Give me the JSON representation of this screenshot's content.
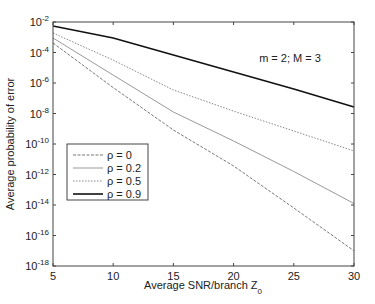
{
  "chart_data": {
    "type": "line",
    "title": "",
    "annotation": "m = 2; M = 3",
    "xlabel": "Average SNR/branch Z",
    "xlabel_subscript": "0",
    "ylabel": "Average probability of error",
    "xlim": [
      5,
      30
    ],
    "ylim_log10": [
      -18,
      -2
    ],
    "yscale": "log",
    "grid": false,
    "legend_position": "lower-left",
    "x_ticks": [
      5,
      10,
      15,
      20,
      25,
      30
    ],
    "y_ticks": [
      {
        "base": "10",
        "exp": "-2",
        "log": -2
      },
      {
        "base": "10",
        "exp": "-4",
        "log": -4
      },
      {
        "base": "10",
        "exp": "-6",
        "log": -6
      },
      {
        "base": "10",
        "exp": "-8",
        "log": -8
      },
      {
        "base": "10",
        "exp": "-10",
        "log": -10
      },
      {
        "base": "10",
        "exp": "-12",
        "log": -12
      },
      {
        "base": "10",
        "exp": "-14",
        "log": -14
      },
      {
        "base": "10",
        "exp": "-16",
        "log": -16
      },
      {
        "base": "10",
        "exp": "-18",
        "log": -18
      }
    ],
    "x": [
      5,
      10,
      15,
      20,
      25,
      30
    ],
    "series": [
      {
        "name": "ρ = 0",
        "style": "dashed",
        "color": "#777777",
        "width": 1.0,
        "log10_values": [
          -3.38,
          -6.3,
          -9.08,
          -11.44,
          -14.2,
          -17.0
        ],
        "values": [
          0.00042,
          5e-07,
          8.3e-10,
          3.6e-12,
          6.3e-15,
          1e-17
        ]
      },
      {
        "name": "ρ = 0.2",
        "style": "solid",
        "color": "#999999",
        "width": 1.0,
        "log10_values": [
          -3.05,
          -5.48,
          -7.9,
          -9.8,
          -11.8,
          -13.9
        ],
        "values": [
          0.00089,
          3.3e-06,
          1.3e-08,
          1.6e-10,
          1.6e-12,
          1.3e-14
        ]
      },
      {
        "name": "ρ = 0.5",
        "style": "dotted",
        "color": "#888888",
        "width": 1.0,
        "log10_values": [
          -2.72,
          -4.5,
          -6.46,
          -7.84,
          -9.15,
          -10.46
        ],
        "values": [
          0.0019,
          3.2e-05,
          3.5e-07,
          1.4e-08,
          7.1e-10,
          3.5e-11
        ]
      },
      {
        "name": "ρ = 0.9",
        "style": "solid",
        "color": "#111111",
        "width": 1.6,
        "log10_values": [
          -2.26,
          -3.05,
          -4.16,
          -5.28,
          -6.39,
          -7.57
        ],
        "values": [
          0.0055,
          0.00089,
          6.9e-05,
          5.2e-06,
          4.1e-07,
          2.7e-08
        ]
      }
    ]
  }
}
